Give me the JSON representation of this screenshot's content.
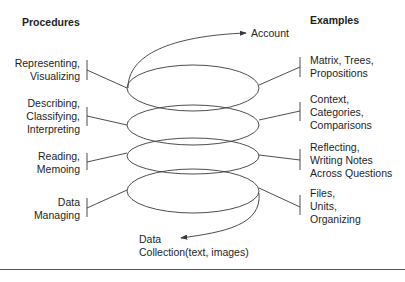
{
  "headings": {
    "procedures": "Procedures",
    "examples": "Examples"
  },
  "top_output": "Account",
  "bottom_input": {
    "line1": "Data",
    "line2": "Collection(text, images)"
  },
  "procedures": [
    {
      "text": "Representing,\nVisualizing"
    },
    {
      "text": "Describing,\nClassifying,\nInterpreting"
    },
    {
      "text": "Reading,\nMemoing"
    },
    {
      "text": "Data\nManaging"
    }
  ],
  "examples": [
    {
      "text": "Matrix, Trees,\nPropositions"
    },
    {
      "text": "Context,\nCategories,\nComparisons"
    },
    {
      "text": "Reflecting,\nWriting Notes\nAcross Questions"
    },
    {
      "text": "Files,\nUnits,\nOrganizing"
    }
  ],
  "colors": {
    "line": "#3a3a3a",
    "text": "#1e1e1e",
    "background": "#ffffff"
  }
}
